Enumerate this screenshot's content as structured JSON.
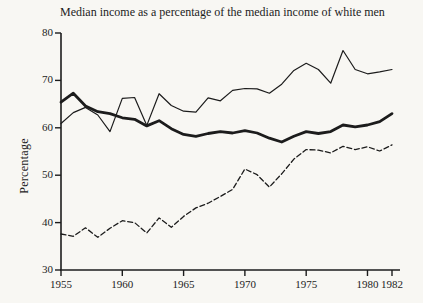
{
  "title": "Median income as a percentage of the median income of white men",
  "colors": {
    "ink": "#1c1c1c",
    "background": "#f8f7f3"
  },
  "y_axis": {
    "label": "Percentage",
    "ticks": [
      80,
      70,
      60,
      50,
      40,
      30
    ]
  },
  "x_axis": {
    "ticks": [
      1955,
      1960,
      1965,
      1970,
      1975,
      1980,
      1982
    ]
  },
  "chart_data": {
    "type": "line",
    "title": "Median income as a percentage of the median income of white men",
    "xlabel": "",
    "ylabel": "Percentage",
    "xlim": [
      1955,
      1982
    ],
    "ylim": [
      30,
      80
    ],
    "grid": false,
    "legend": "none",
    "x": [
      1955,
      1956,
      1957,
      1958,
      1959,
      1960,
      1961,
      1962,
      1963,
      1964,
      1965,
      1966,
      1967,
      1968,
      1969,
      1970,
      1971,
      1972,
      1973,
      1974,
      1975,
      1976,
      1977,
      1978,
      1979,
      1980,
      1981,
      1982
    ],
    "series": [
      {
        "name": "thin-solid-line",
        "style": "solid-thin",
        "values": [
          60.9,
          63.2,
          64.3,
          62.7,
          59.2,
          66.2,
          66.4,
          60.5,
          67.2,
          64.7,
          63.5,
          63.3,
          66.3,
          65.7,
          67.9,
          68.3,
          68.2,
          67.3,
          69.2,
          72.1,
          73.6,
          72.3,
          69.4,
          76.3,
          72.3,
          71.4,
          71.8,
          72.3
        ]
      },
      {
        "name": "thick-solid-line",
        "style": "solid-thick",
        "values": [
          65.4,
          67.3,
          64.6,
          63.4,
          63.0,
          62.1,
          61.8,
          60.4,
          61.5,
          59.8,
          58.6,
          58.2,
          58.8,
          59.2,
          58.9,
          59.4,
          58.9,
          57.8,
          57.0,
          58.2,
          59.2,
          58.8,
          59.2,
          60.6,
          60.2,
          60.6,
          61.3,
          63.0
        ]
      },
      {
        "name": "dashed-line",
        "style": "dashed",
        "values": [
          37.6,
          37.1,
          38.9,
          36.9,
          38.8,
          40.4,
          40.0,
          37.8,
          41.0,
          39.0,
          41.3,
          43.1,
          44.1,
          45.5,
          47.0,
          51.3,
          50.1,
          47.5,
          50.3,
          53.4,
          55.4,
          55.3,
          54.7,
          56.1,
          55.4,
          56.0,
          55.1,
          56.4
        ]
      }
    ]
  }
}
